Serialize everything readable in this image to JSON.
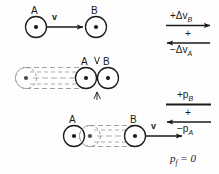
{
  "figure": {
    "background_color": "#fefefe",
    "ink_color": "#1a1a1a"
  },
  "rows": [
    {
      "id": "before-collision",
      "caption": "A moving right toward stationary B",
      "objects": [
        {
          "name": "A",
          "label": "A",
          "cx": 36,
          "cy": 27,
          "r": 11,
          "moving": true,
          "trail": false
        },
        {
          "name": "B",
          "label": "B",
          "cx": 96,
          "cy": 27,
          "r": 11,
          "moving": false,
          "trail": false
        }
      ],
      "velocity_arrow": {
        "label": "v",
        "x1": 47,
        "y1": 27,
        "x2": 84,
        "y2": 27,
        "direction": "right"
      }
    },
    {
      "id": "at-collision",
      "caption": "A has travelled right and strikes B",
      "objects": [
        {
          "name": "A",
          "label": "A",
          "cx": 86,
          "cy": 78,
          "r": 11,
          "moving": false,
          "trail": true
        },
        {
          "name": "B",
          "label": "B",
          "cx": 108,
          "cy": 78,
          "r": 11,
          "moving": false,
          "trail": false
        }
      ],
      "trail": {
        "from_cx": 26,
        "to_cx": 86,
        "cy": 78,
        "r": 11
      },
      "impact": {
        "cx": 97,
        "cy": 78
      }
    },
    {
      "id": "after-collision",
      "caption": "A at rest, B moves right",
      "objects": [
        {
          "name": "A",
          "label": "A",
          "cx": 74,
          "cy": 136,
          "r": 11,
          "moving": false,
          "trail": false
        },
        {
          "name": "B",
          "label": "B",
          "cx": 135,
          "cy": 136,
          "r": 11,
          "moving": true,
          "trail": true
        }
      ],
      "trail": {
        "from_cx": 90,
        "to_cx": 135,
        "cy": 136,
        "r": 11
      },
      "velocity_arrow": {
        "label": "v",
        "x1": 146,
        "y1": 136,
        "x2": 183,
        "y2": 136,
        "direction": "right"
      }
    }
  ],
  "velocity_block": {
    "id": "velocity-change-block",
    "top_term": {
      "sign": "+",
      "symbol": "Δv",
      "subscript": "B"
    },
    "top_arrow_direction": "right",
    "operator": "+",
    "bottom_arrow_direction": "left",
    "bottom_term": {
      "sign": "−",
      "symbol": "Δv",
      "subscript": "A"
    }
  },
  "momentum_block": {
    "id": "momentum-block",
    "top_term": {
      "sign": "+",
      "symbol": "p",
      "subscript": "B"
    },
    "top_arrow_direction": "right",
    "operator": "+",
    "bottom_arrow_direction": "left",
    "bottom_term": {
      "sign": "−",
      "symbol": "p",
      "subscript": "A"
    }
  },
  "result": {
    "id": "final-momentum",
    "symbol": "p",
    "subscript": "f",
    "relation": "=",
    "value": "0"
  }
}
